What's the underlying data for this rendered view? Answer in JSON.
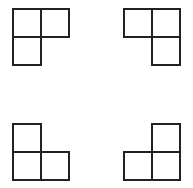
{
  "diagram": {
    "stroke_color": "#222222",
    "background": "#ffffff",
    "cell_size": 28,
    "shapes": [
      {
        "name": "top-left",
        "orientation": "missing bottom-right cell",
        "cells": [
          [
            13,
            9
          ],
          [
            41,
            9
          ],
          [
            13,
            37
          ]
        ]
      },
      {
        "name": "top-right",
        "orientation": "missing bottom-left cell",
        "cells": [
          [
            124,
            9
          ],
          [
            152,
            9
          ],
          [
            152,
            37
          ]
        ]
      },
      {
        "name": "bottom-left",
        "orientation": "missing top-right cell",
        "cells": [
          [
            13,
            124
          ],
          [
            13,
            152
          ],
          [
            41,
            152
          ]
        ]
      },
      {
        "name": "bottom-right",
        "orientation": "missing top-left cell",
        "cells": [
          [
            152,
            124
          ],
          [
            124,
            152
          ],
          [
            152,
            152
          ]
        ]
      }
    ]
  }
}
